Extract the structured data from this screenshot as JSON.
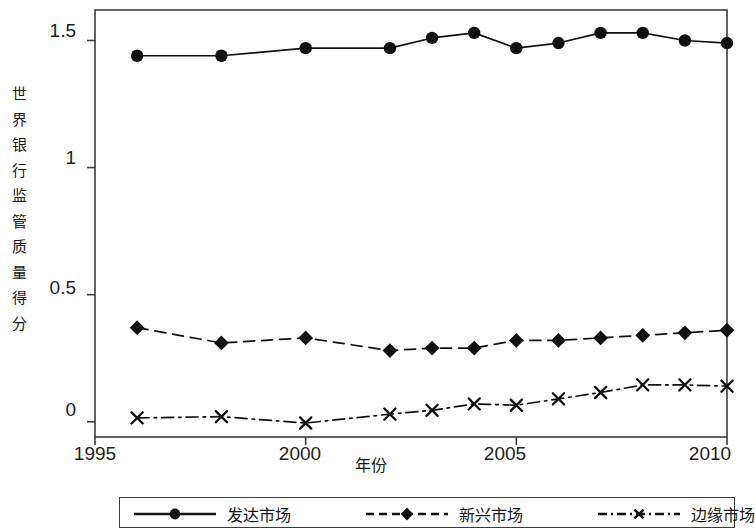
{
  "chart_data": {
    "type": "line",
    "title": "",
    "xlabel": "年份",
    "ylabel": "世界银行监管质量得分",
    "ylabel_chars": [
      "世",
      "界",
      "银",
      "行",
      "监",
      "管",
      "质",
      "量",
      "得",
      "分"
    ],
    "x": [
      1996,
      1998,
      2000,
      2002,
      2003,
      2004,
      2005,
      2006,
      2007,
      2008,
      2009,
      2010
    ],
    "xlim": [
      1995,
      2010
    ],
    "ylim": [
      -0.06,
      1.62
    ],
    "xticks": [
      1995,
      2000,
      2005,
      2010
    ],
    "xtick_labels": [
      "1995",
      "2000",
      "2005",
      "2010"
    ],
    "yticks": [
      0,
      0.5,
      1,
      1.5
    ],
    "ytick_labels": [
      "0",
      "0.5",
      "1",
      "1.5"
    ],
    "grid": false,
    "legend_position": "bottom",
    "series": [
      {
        "name": "发达市场",
        "marker": "circle",
        "linestyle": "solid",
        "color": "#111111",
        "values": [
          1.44,
          1.44,
          1.47,
          1.47,
          1.51,
          1.53,
          1.47,
          1.49,
          1.53,
          1.53,
          1.5,
          1.49
        ]
      },
      {
        "name": "新兴市场",
        "marker": "diamond",
        "linestyle": "dashed",
        "color": "#111111",
        "values": [
          0.37,
          0.31,
          0.33,
          0.28,
          0.29,
          0.29,
          0.32,
          0.32,
          0.33,
          0.34,
          0.35,
          0.36
        ]
      },
      {
        "name": "边缘市场",
        "marker": "x",
        "linestyle": "dashdot",
        "color": "#111111",
        "values": [
          0.015,
          0.02,
          -0.005,
          0.03,
          0.045,
          0.07,
          0.065,
          0.09,
          0.115,
          0.145,
          0.145,
          0.14
        ]
      }
    ]
  },
  "legend": {
    "items": [
      {
        "label": "发达市场"
      },
      {
        "label": "新兴市场"
      },
      {
        "label": "边缘市场"
      }
    ]
  },
  "axes": {
    "y_title": "世界银行监管质量得分",
    "x_title": "年份",
    "ytick_0": "0",
    "ytick_1": "0.5",
    "ytick_2": "1",
    "ytick_3": "1.5",
    "xtick_0": "1995",
    "xtick_1": "2000",
    "xtick_2": "2005",
    "xtick_3": "2010"
  }
}
